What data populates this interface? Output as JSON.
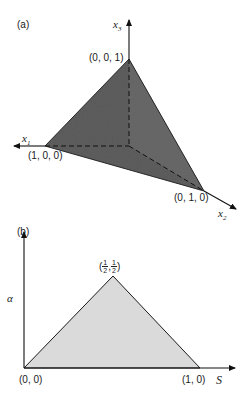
{
  "panel_a": {
    "label": "(a)",
    "axes": {
      "x1": {
        "symbol": "x",
        "sub": "1"
      },
      "x2": {
        "symbol": "x",
        "sub": "2"
      },
      "x3": {
        "symbol": "x",
        "sub": "3"
      }
    },
    "vertices": {
      "top": "(0, 0, 1)",
      "left": "(1, 0, 0)",
      "right": "(0, 1, 0)"
    },
    "fill_color": "#5a5a5a"
  },
  "panel_b": {
    "label": "(b)",
    "y_axis_label": "α",
    "x_axis_label": "S",
    "vertices": {
      "origin": "(0, 0)",
      "right": "(1, 0)",
      "apex_open": "(",
      "apex_num1": "1",
      "apex_den1": "2",
      "apex_sep": ",",
      "apex_num2": "1",
      "apex_den2": "2",
      "apex_close": ")"
    },
    "fill_color": "#d9d9d9"
  }
}
